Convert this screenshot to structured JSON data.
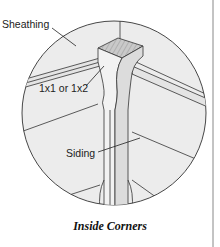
{
  "figure": {
    "caption": "Inside Corners",
    "labels": {
      "sheathing": "Sheathing",
      "corner_strip": "1x1 or 1x2",
      "siding": "Siding"
    },
    "colors": {
      "background": "#ffffff",
      "detail_fill": "#ececec",
      "line": "#333333",
      "end_grain": "#bdbdbd"
    }
  }
}
